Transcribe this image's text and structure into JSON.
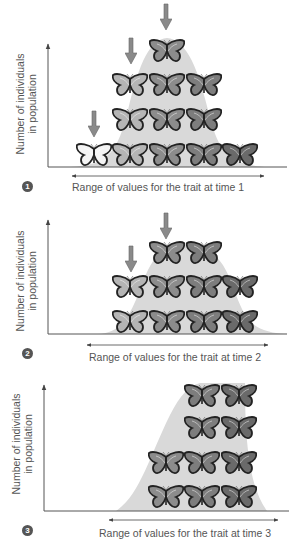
{
  "figure": {
    "y_axis_label_line1": "Number of individuals",
    "y_axis_label_line2": "in population",
    "colors": {
      "curve_fill": "#d9d9d9",
      "axis": "#555555",
      "arrow_marker": "#8a8a8a",
      "butterfly_dark": "#5a5a5a",
      "butterfly_mid": "#8c8c8c",
      "butterfly_light": "#f4f4f4"
    },
    "panels": [
      {
        "step": "1",
        "x_axis_label": "Range of values for the trait at time 1",
        "rows_bottom_to_top": [
          5,
          3,
          3,
          1
        ],
        "selection_arrows": 3
      },
      {
        "step": "2",
        "x_axis_label": "Range of values for the trait at time 2",
        "rows_bottom_to_top": [
          4,
          4,
          2
        ],
        "selection_arrows": 2
      },
      {
        "step": "3",
        "x_axis_label": "Range of values for the trait at time 3",
        "rows_bottom_to_top": [
          3,
          3,
          2,
          2
        ],
        "selection_arrows": 0
      }
    ]
  }
}
